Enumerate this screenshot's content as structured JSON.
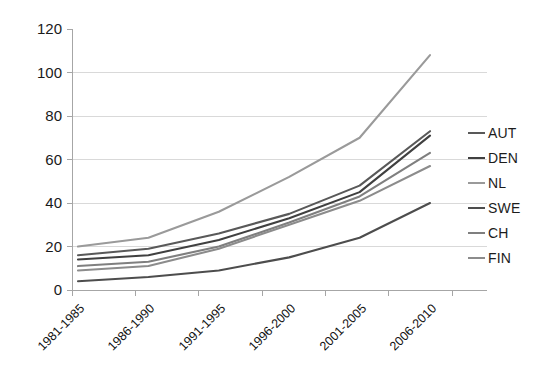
{
  "chart_data": {
    "type": "line",
    "title": "",
    "subtitle": "",
    "xlabel": "",
    "ylabel": "",
    "categories": [
      "1981-1985",
      "1986-1990",
      "1991-1995",
      "1996-2000",
      "2001-2005",
      "2006-2010"
    ],
    "ylim": [
      0,
      120
    ],
    "yticks": [
      0,
      20,
      40,
      60,
      80,
      100,
      120
    ],
    "ytick_labels": [
      "0",
      "20",
      "40",
      "60",
      "80",
      "100",
      "120"
    ],
    "grid": "horizontal",
    "legend_position": "right",
    "series": [
      {
        "name": "AUT",
        "color": "#595959",
        "values": [
          16,
          19,
          26,
          35,
          48,
          73
        ]
      },
      {
        "name": "DEN",
        "color": "#404040",
        "values": [
          14,
          16,
          23,
          33,
          45,
          71
        ]
      },
      {
        "name": "NL",
        "color": "#9a9a9a",
        "values": [
          20,
          24,
          36,
          52,
          70,
          108
        ]
      },
      {
        "name": "SWE",
        "color": "#4d4d4d",
        "values": [
          4,
          6,
          9,
          15,
          24,
          40
        ]
      },
      {
        "name": "CH",
        "color": "#7f7f7f",
        "values": [
          11,
          13,
          20,
          31,
          43,
          63
        ]
      },
      {
        "name": "FIN",
        "color": "#8c8c8c",
        "values": [
          9,
          11,
          19,
          30,
          41,
          57
        ]
      }
    ]
  },
  "legend": {
    "items": [
      {
        "label": "AUT"
      },
      {
        "label": "DEN"
      },
      {
        "label": "NL"
      },
      {
        "label": "SWE"
      },
      {
        "label": "CH"
      },
      {
        "label": "FIN"
      }
    ]
  },
  "axes": {
    "y_labels": [
      "120",
      "100",
      "80",
      "60",
      "40",
      "20",
      "0"
    ],
    "x_labels": [
      "1981-1985",
      "1986-1990",
      "1991-1995",
      "1996-2000",
      "2001-2005",
      "2006-2010"
    ]
  },
  "colors": {
    "axis": "#a6a6a6",
    "grid": "#d9d9d9",
    "text": "#1a1a1a",
    "background": "#ffffff"
  }
}
